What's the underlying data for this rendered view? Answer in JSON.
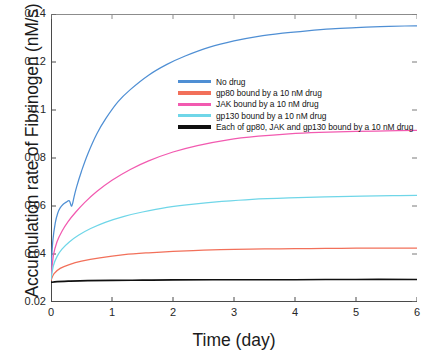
{
  "chart_data": {
    "type": "line",
    "title": "",
    "xlabel": "Time (day)",
    "ylabel": "Accumulation rate of Fibrinogen (nM/s)",
    "xlim": [
      0,
      6
    ],
    "ylim": [
      0.02,
      0.14
    ],
    "xticks": [
      "0",
      "1",
      "2",
      "3",
      "4",
      "5",
      "6"
    ],
    "yticks": [
      "0.02",
      "0.04",
      "0.06",
      "0.08",
      "0.1",
      "0.12",
      "0.14"
    ],
    "grid": false,
    "legend_position": "upper center",
    "series": [
      {
        "name": "No drug",
        "color": "#4f8fd4",
        "x": [
          0,
          0.03,
          0.07,
          0.11,
          0.15,
          0.2,
          0.25,
          0.3,
          0.34,
          0.38,
          0.42,
          0.5,
          0.6,
          0.75,
          0.9,
          1.1,
          1.3,
          1.6,
          1.9,
          2.2,
          2.6,
          3.0,
          3.4,
          3.8,
          4.2,
          4.6,
          5.0,
          5.4,
          5.8,
          6.0
        ],
        "y": [
          0.0335,
          0.0455,
          0.053,
          0.057,
          0.0592,
          0.0607,
          0.0616,
          0.0622,
          0.06,
          0.064,
          0.068,
          0.0745,
          0.0815,
          0.09,
          0.0965,
          0.1035,
          0.1085,
          0.1145,
          0.119,
          0.1225,
          0.1262,
          0.1288,
          0.1307,
          0.132,
          0.133,
          0.1338,
          0.1343,
          0.1347,
          0.135,
          0.1351
        ]
      },
      {
        "name": "gp80 bound by a 10 nM drug",
        "color": "#f2705a",
        "x": [
          0,
          0.05,
          0.15,
          0.3,
          0.5,
          0.8,
          1.2,
          1.6,
          2.0,
          2.5,
          3.0,
          3.5,
          4.0,
          4.5,
          5.0,
          5.5,
          6.0
        ],
        "y": [
          0.029,
          0.0318,
          0.034,
          0.0356,
          0.037,
          0.0384,
          0.0397,
          0.0405,
          0.0411,
          0.0416,
          0.0419,
          0.0421,
          0.0422,
          0.0423,
          0.0424,
          0.0424,
          0.0425
        ]
      },
      {
        "name": "JAK bound by a 10 nM drug",
        "color": "#f25ab0",
        "x": [
          0,
          0.04,
          0.1,
          0.18,
          0.28,
          0.4,
          0.55,
          0.75,
          1.0,
          1.3,
          1.6,
          2.0,
          2.4,
          2.9,
          3.4,
          3.9,
          4.4,
          5.0,
          5.5,
          6.0
        ],
        "y": [
          0.03,
          0.0395,
          0.0452,
          0.0495,
          0.0535,
          0.0573,
          0.0614,
          0.066,
          0.0707,
          0.0752,
          0.0788,
          0.0825,
          0.0852,
          0.0876,
          0.0891,
          0.0901,
          0.0907,
          0.0911,
          0.0913,
          0.0915
        ]
      },
      {
        "name": "gp130 bound by a 10 nM drug",
        "color": "#6fd6e8",
        "x": [
          0,
          0.04,
          0.1,
          0.18,
          0.3,
          0.45,
          0.65,
          0.9,
          1.2,
          1.5,
          1.9,
          2.3,
          2.8,
          3.3,
          3.9,
          4.5,
          5.1,
          5.6,
          6.0
        ],
        "y": [
          0.0295,
          0.0352,
          0.039,
          0.042,
          0.045,
          0.0478,
          0.0506,
          0.0533,
          0.0557,
          0.0575,
          0.0594,
          0.0607,
          0.0619,
          0.0628,
          0.0634,
          0.0638,
          0.0641,
          0.0643,
          0.0644
        ]
      },
      {
        "name": "Each of gp80, JAK and gp130 bound by a 10 nM drug",
        "color": "#101010",
        "x": [
          0,
          0.1,
          0.3,
          0.6,
          1.0,
          1.5,
          2.0,
          3.0,
          4.0,
          5.0,
          6.0
        ],
        "y": [
          0.0282,
          0.0285,
          0.0287,
          0.0289,
          0.029,
          0.0291,
          0.0292,
          0.0293,
          0.0293,
          0.0294,
          0.0294
        ]
      }
    ]
  }
}
